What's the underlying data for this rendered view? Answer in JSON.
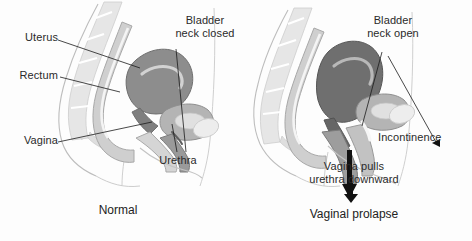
{
  "figure": {
    "type": "medical-illustration",
    "background_color": "#fdfdfd",
    "text_color": "#2a2a2a"
  },
  "panels": [
    {
      "id": "normal",
      "caption": "Normal",
      "labels": [
        {
          "name": "uterus",
          "text": "Uterus"
        },
        {
          "name": "rectum",
          "text": "Rectum"
        },
        {
          "name": "vagina",
          "text": "Vagina"
        },
        {
          "name": "urethra",
          "text": "Urethra"
        },
        {
          "name": "bladder-neck",
          "text": "Bladder\nneck closed",
          "line1": "Bladder",
          "line2": "neck closed"
        }
      ]
    },
    {
      "id": "prolapse",
      "caption": "Vaginal prolapse",
      "labels": [
        {
          "name": "bladder-neck",
          "text": "Bladder\nneck open",
          "line1": "Bladder",
          "line2": "neck open"
        },
        {
          "name": "incontinence",
          "text": "Incontinence"
        },
        {
          "name": "vagina-pulls",
          "text": "Vagina pulls\nurethra downward",
          "line1": "Vagina pulls",
          "line2": "urethra downward"
        }
      ]
    }
  ],
  "colors": {
    "body_outline": "#b9b9b9",
    "bone_light": "#e3e3e3",
    "tissue_light": "#d8d8d8",
    "tissue_mid": "#b0b0b0",
    "organ_dark": "#8a8a8a",
    "organ_darkest": "#6e6e6e",
    "cavity_white": "#f7f7f7",
    "leader_line": "#1a1a1a",
    "arrow_black": "#111111"
  }
}
